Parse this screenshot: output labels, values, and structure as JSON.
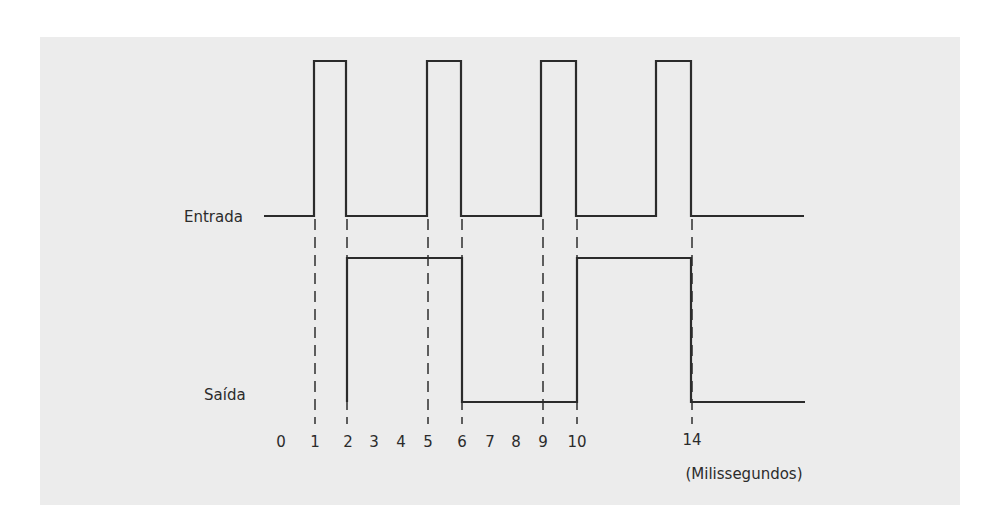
{
  "diagram": {
    "type": "timing-diagram",
    "signals": [
      {
        "name": "input",
        "label": "Entrada",
        "description": "Input pulse train",
        "pulses_high_ms": [
          [
            1,
            2
          ],
          [
            5,
            6
          ],
          [
            9,
            10
          ],
          [
            13.5,
            14
          ]
        ]
      },
      {
        "name": "output",
        "label": "Saída",
        "description": "Output toggles on each input falling edge",
        "high_intervals_ms": [
          [
            2,
            6
          ],
          [
            10,
            14
          ]
        ]
      }
    ],
    "time_axis": {
      "unit_label": "(Milissegundos)",
      "ticks": [
        "0",
        "1",
        "2",
        "3",
        "4",
        "5",
        "6",
        "7",
        "8",
        "9",
        "10",
        "14"
      ]
    },
    "guide_lines_at_ms": [
      "1",
      "2",
      "5",
      "6",
      "9",
      "10",
      "14"
    ]
  },
  "layout": {
    "colors": {
      "panel": "#ececec",
      "ink": "#2b2b2b",
      "background": "#ffffff"
    },
    "tick_x": [
      281,
      315,
      348,
      374,
      401,
      428,
      462,
      490,
      516,
      543,
      577,
      692
    ],
    "guide_x": [
      315,
      347,
      428,
      462,
      543,
      577,
      692
    ],
    "input": {
      "low_y": 216,
      "high_y": 61,
      "start_x": 264,
      "end_x": 804,
      "pulses_x": [
        [
          314,
          346
        ],
        [
          427,
          461
        ],
        [
          541,
          576
        ],
        [
          656,
          691
        ]
      ]
    },
    "output": {
      "low_y": 402,
      "high_y": 258,
      "end_x": 805,
      "path_x": {
        "rise1": 347,
        "fall1": 462,
        "rise2": 577,
        "fall2": 691
      }
    }
  }
}
